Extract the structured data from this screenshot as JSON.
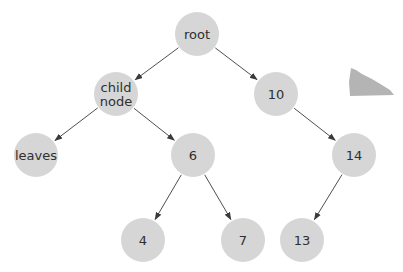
{
  "diagram": {
    "type": "binary-tree",
    "colors": {
      "node_fill": "#d6d6d6",
      "edge": "#3a3a3a",
      "text": "#2f2f2f",
      "decoration": "#b4b4b4",
      "background": "#ffffff"
    },
    "node_radius": 22,
    "nodes": [
      {
        "id": "root",
        "lines": [
          "root"
        ],
        "x": 197,
        "y": 34
      },
      {
        "id": "child",
        "lines": [
          "child",
          "node"
        ],
        "x": 116,
        "y": 94
      },
      {
        "id": "n10",
        "lines": [
          "10"
        ],
        "x": 276,
        "y": 94
      },
      {
        "id": "leaves",
        "lines": [
          "leaves"
        ],
        "x": 36,
        "y": 155
      },
      {
        "id": "n6",
        "lines": [
          "6"
        ],
        "x": 193,
        "y": 155
      },
      {
        "id": "n14",
        "lines": [
          "14"
        ],
        "x": 354,
        "y": 155
      },
      {
        "id": "n4",
        "lines": [
          "4"
        ],
        "x": 143,
        "y": 240
      },
      {
        "id": "n7",
        "lines": [
          "7"
        ],
        "x": 243,
        "y": 240
      },
      {
        "id": "n13",
        "lines": [
          "13"
        ],
        "x": 302,
        "y": 240
      }
    ],
    "edges": [
      {
        "from": "root",
        "to": "child"
      },
      {
        "from": "root",
        "to": "n10"
      },
      {
        "from": "child",
        "to": "leaves"
      },
      {
        "from": "child",
        "to": "n6"
      },
      {
        "from": "n10",
        "to": "n14"
      },
      {
        "from": "n6",
        "to": "n4"
      },
      {
        "from": "n6",
        "to": "n7"
      },
      {
        "from": "n14",
        "to": "n13"
      }
    ],
    "decoration": {
      "name": "gray-wedge-shape",
      "points": "351,68 356,70 362,74 372,79 382,85 390,90 394,95 350,96 349,82"
    }
  }
}
